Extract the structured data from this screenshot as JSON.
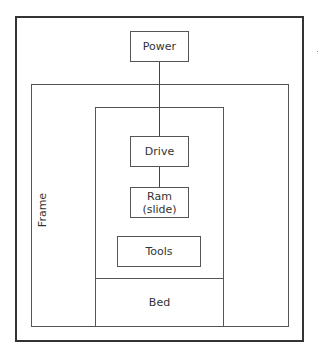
{
  "diagram": {
    "nodes": {
      "power": "Power",
      "frame": "Frame",
      "drive": "Drive",
      "ram": "Ram\n(slide)",
      "ram_line1": "Ram",
      "ram_line2": "(slide)",
      "tools": "Tools",
      "bed": "Bed"
    },
    "connections": [
      {
        "from": "Power",
        "to": "Drive"
      },
      {
        "from": "Drive",
        "to": "Ram (slide)"
      }
    ],
    "colors": {
      "line": "#444444",
      "background": "#ffffff"
    }
  }
}
